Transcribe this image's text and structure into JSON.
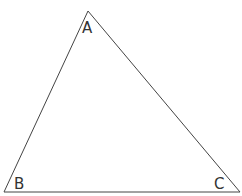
{
  "diagram": {
    "type": "triangle",
    "stroke_color": "#444444",
    "vertices": {
      "A": {
        "label": "A",
        "x": 88,
        "y": 11
      },
      "B": {
        "label": "B",
        "x": 4,
        "y": 192
      },
      "C": {
        "label": "C",
        "x": 240,
        "y": 192
      }
    }
  }
}
